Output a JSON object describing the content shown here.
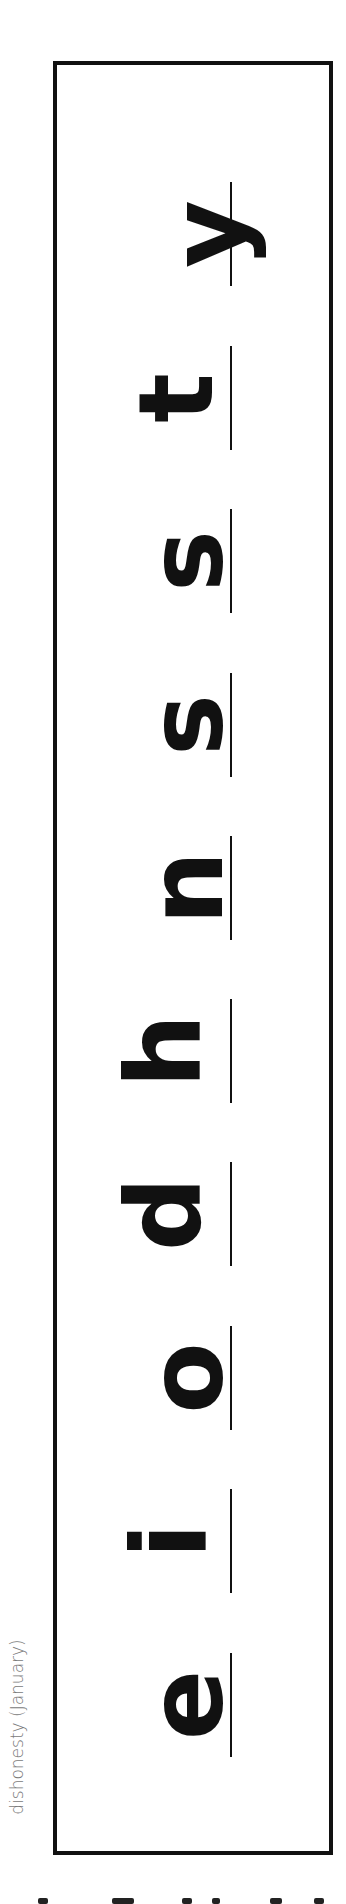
{
  "worksheet": {
    "word_label": "dishonesty (January)",
    "letters": [
      "e",
      "i",
      "o",
      "d",
      "h",
      "n",
      "s",
      "s",
      "t",
      "y"
    ],
    "orientation": "rotated-90-ccw",
    "colors": {
      "ink": "#111111",
      "label": "#7a7a7a",
      "background": "#ffffff"
    }
  }
}
